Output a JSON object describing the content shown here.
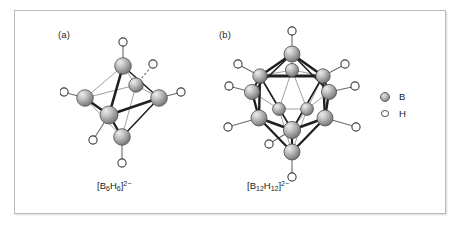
{
  "figure": {
    "background_color": "#ffffff",
    "frame_border_color": "#b9b9b9",
    "panels": [
      {
        "id": "a",
        "label": "(a)",
        "formula_html": "[B<sub>6</sub>H<sub>6</sub>]<sup>2−</sup>",
        "formula_plain": "[B6H6]2-",
        "geometry": "octahedron",
        "boron_count": 6,
        "hydrogen_count": 12
      },
      {
        "id": "b",
        "label": "(b)",
        "formula_html": "[B<sub>12</sub>H<sub>12</sub>]<sup>2−</sup>",
        "formula_plain": "[B12H12]2-",
        "geometry": "icosahedron",
        "boron_count": 12,
        "hydrogen_count": 12
      }
    ]
  },
  "legend": {
    "items": [
      {
        "symbol": "B",
        "icon": "filled-sphere-icon",
        "color": "#a9a9a9"
      },
      {
        "symbol": "H",
        "icon": "open-circle-icon",
        "color": "#ffffff"
      }
    ]
  },
  "margin_note": {
    "lines": [
      "",
      "",
      ""
    ]
  },
  "chart_data": {
    "type": "diagram",
    "subtype": "ball-and-stick molecular structures",
    "structures": [
      {
        "name": "[B6H6]2-",
        "polyhedron": "octahedron",
        "vertices": 6,
        "edges": 12,
        "faces": 8,
        "terminal_H_per_B": 1,
        "charge": -2,
        "boron_positions_px": [
          {
            "id": "B1",
            "x": 63,
            "y": 30,
            "note": "top apex"
          },
          {
            "id": "B2",
            "x": 25,
            "y": 62,
            "note": "left equatorial"
          },
          {
            "id": "B3",
            "x": 49,
            "y": 79,
            "note": "front equatorial"
          },
          {
            "id": "B4",
            "x": 99,
            "y": 62,
            "note": "right equatorial"
          },
          {
            "id": "B5",
            "x": 76,
            "y": 49,
            "note": "rear equatorial"
          },
          {
            "id": "B6",
            "x": 62,
            "y": 101,
            "note": "bottom apex"
          }
        ],
        "hydrogen_positions_px": [
          {
            "id": "H1",
            "x": 63,
            "y": 6
          },
          {
            "id": "H2",
            "x": 3,
            "y": 56
          },
          {
            "id": "H3",
            "x": 33,
            "y": 105
          },
          {
            "id": "H4",
            "x": 122,
            "y": 57
          },
          {
            "id": "H5",
            "x": 94,
            "y": 26
          },
          {
            "id": "H6",
            "x": 62,
            "y": 128
          }
        ]
      },
      {
        "name": "[B12H12]2-",
        "polyhedron": "icosahedron",
        "vertices": 12,
        "edges": 30,
        "faces": 20,
        "terminal_H_per_B": 1,
        "charge": -2,
        "boron_positions_px": [
          {
            "id": "B1",
            "x": 77,
            "y": 28,
            "note": "top apex"
          },
          {
            "id": "B2",
            "x": 45,
            "y": 50,
            "note": "upper ring front-left"
          },
          {
            "id": "B3",
            "x": 77,
            "y": 44,
            "note": "upper ring rear"
          },
          {
            "id": "B4",
            "x": 108,
            "y": 50,
            "note": "upper ring front-right"
          },
          {
            "id": "B5",
            "x": 37,
            "y": 66,
            "note": "upper ring left"
          },
          {
            "id": "B6",
            "x": 114,
            "y": 66,
            "note": "upper ring right"
          },
          {
            "id": "B7",
            "x": 44,
            "y": 92,
            "note": "lower ring left"
          },
          {
            "id": "B8",
            "x": 110,
            "y": 92,
            "note": "lower ring right"
          },
          {
            "id": "B9",
            "x": 64,
            "y": 83,
            "note": "lower ring rear-left"
          },
          {
            "id": "B10",
            "x": 92,
            "y": 83,
            "note": "lower ring rear-right"
          },
          {
            "id": "B11",
            "x": 77,
            "y": 104,
            "note": "lower ring front"
          },
          {
            "id": "B12",
            "x": 77,
            "y": 126,
            "note": "bottom apex"
          }
        ],
        "hydrogen_positions_px": [
          {
            "id": "H1",
            "x": 77,
            "y": 4
          },
          {
            "id": "H2",
            "x": 22,
            "y": 38
          },
          {
            "id": "H3",
            "x": 131,
            "y": 38
          },
          {
            "id": "H4",
            "x": 12,
            "y": 60
          },
          {
            "id": "H5",
            "x": 141,
            "y": 60
          },
          {
            "id": "H6",
            "x": 11,
            "y": 101
          },
          {
            "id": "H7",
            "x": 143,
            "y": 101
          },
          {
            "id": "H8",
            "x": 53,
            "y": 118
          },
          {
            "id": "H9",
            "x": 77,
            "y": 152
          }
        ]
      }
    ],
    "legend_entries": [
      "B",
      "H"
    ]
  }
}
